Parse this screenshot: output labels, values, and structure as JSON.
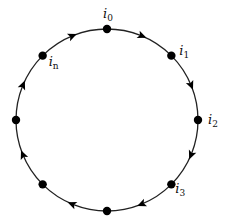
{
  "diagram": {
    "type": "cycle",
    "direction": "clockwise",
    "center": [
      107,
      120
    ],
    "radius": 91,
    "stroke_color": "#222222",
    "node_color": "#000000",
    "nodes": [
      {
        "id": "i0",
        "angle_deg": 90,
        "label": "i",
        "sub": "0",
        "label_dx": -4,
        "label_dy": -11
      },
      {
        "id": "i1",
        "angle_deg": 45,
        "label": "i",
        "sub": "1",
        "label_dx": 8,
        "label_dy": -1
      },
      {
        "id": "i2",
        "angle_deg": 0,
        "label": "i",
        "sub": "2",
        "label_dx": 10,
        "label_dy": 4
      },
      {
        "id": "i3",
        "angle_deg": -45,
        "label": "i",
        "sub": "3",
        "label_dx": 4,
        "label_dy": 9
      },
      {
        "id": "b",
        "angle_deg": -90,
        "label": "",
        "sub": ""
      },
      {
        "id": "bl",
        "angle_deg": -135,
        "label": "",
        "sub": ""
      },
      {
        "id": "l",
        "angle_deg": 180,
        "label": "",
        "sub": ""
      },
      {
        "id": "in",
        "angle_deg": 135,
        "label": "i",
        "sub": "n",
        "label_dx": 6,
        "label_dy": 10
      }
    ],
    "arrows_at_deg": [
      67.5,
      22.5,
      -22.5,
      -67.5,
      -112.5,
      -157.5,
      157.5,
      112.5
    ]
  }
}
